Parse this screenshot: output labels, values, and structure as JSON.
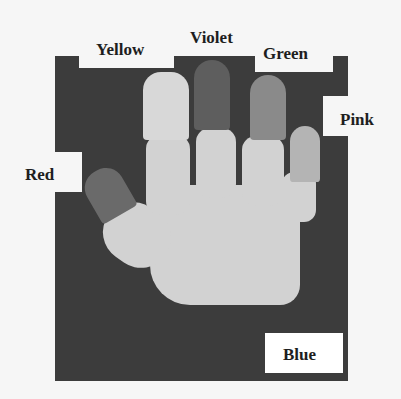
{
  "figure": {
    "labels": {
      "yellow": "Yellow",
      "violet": "Violet",
      "green": "Green",
      "pink": "Pink",
      "red": "Red",
      "blue": "Blue"
    },
    "colors": {
      "background": "#3c3c3c",
      "glove": "#d2d2d2",
      "yellow_tip": "#d8d8d8",
      "violet_tip": "#5e5e5e",
      "green_tip": "#8a8a8a",
      "pink_tip": "#b4b4b4",
      "red_tip": "#6a6a6a"
    }
  }
}
